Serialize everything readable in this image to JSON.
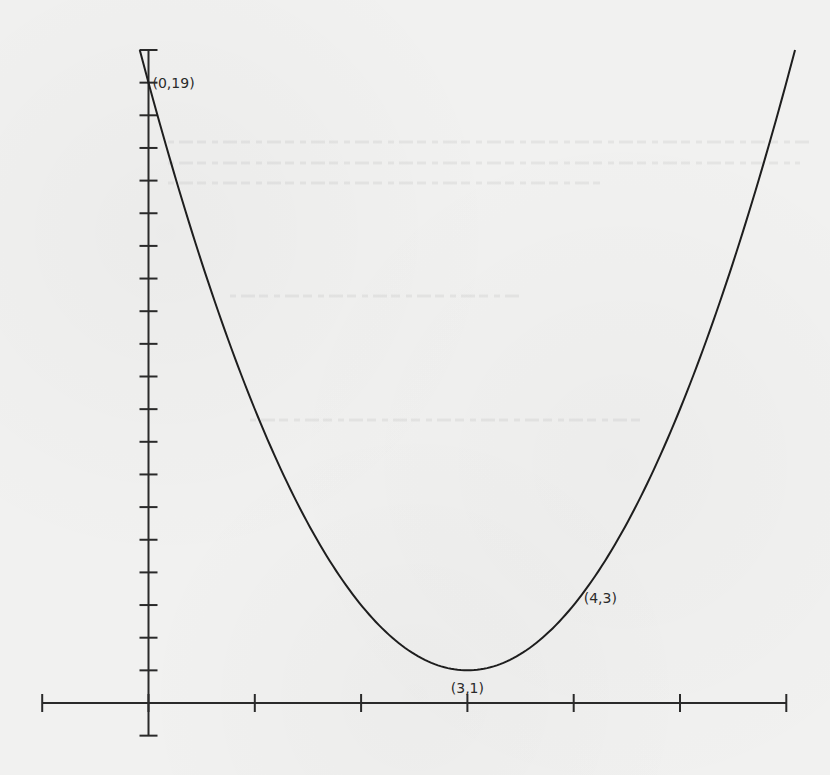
{
  "chart_data": {
    "type": "line",
    "title": "",
    "xlabel": "",
    "ylabel": "",
    "function": "y = 2(x - 3)^2 + 1",
    "coefficients": {
      "a": 2,
      "h": 3,
      "k": 1
    },
    "xlim": [
      -1,
      6
    ],
    "ylim": [
      -1,
      20
    ],
    "grid": false,
    "legend": null,
    "x_ticks": [
      -1,
      0,
      1,
      2,
      3,
      4,
      5,
      6
    ],
    "y_ticks": [
      1,
      2,
      3,
      4,
      5,
      6,
      7,
      8,
      9,
      10,
      11,
      12,
      13,
      14,
      15,
      16,
      17,
      18,
      19,
      20
    ],
    "x_tick_labels_shown": false,
    "y_tick_labels_shown": false,
    "series": [
      {
        "name": "parabola",
        "x": [
          0,
          0.5,
          1,
          1.5,
          2,
          2.5,
          3,
          3.5,
          4,
          4.5,
          5,
          5.5,
          6
        ],
        "y": [
          19,
          13.5,
          9,
          5.5,
          3,
          1.5,
          1,
          1.5,
          3,
          5.5,
          9,
          13.5,
          19
        ]
      }
    ],
    "annotations": [
      {
        "label": "(0,19)",
        "x": 0,
        "y": 19,
        "position": "right"
      },
      {
        "label": "(3,1)",
        "x": 3,
        "y": 1,
        "position": "below",
        "note": "vertex"
      },
      {
        "label": "(4,3)",
        "x": 4,
        "y": 3,
        "position": "right"
      }
    ]
  },
  "labels": {
    "point_0_19": "(0,19)",
    "point_3_1": "(3,1)",
    "point_4_3": "(4,3)"
  },
  "colors": {
    "background": "#f1f1f0",
    "ink": "#1e1e1e"
  }
}
